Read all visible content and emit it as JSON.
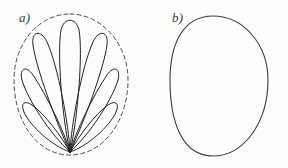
{
  "figure": {
    "background_color": "#fdfdfd",
    "width": 288,
    "height": 168,
    "panels": [
      {
        "id": "a",
        "label": "a)",
        "description": "Fan of seven narrow petal-shaped loops radiating from a single common point at the bottom, inscribed in a dashed ovoid envelope",
        "label_x": 19,
        "label_y": 10,
        "origin": {
          "x": 70,
          "y": 152
        },
        "envelope": {
          "style": "dashed",
          "color": "#4a4a4a",
          "dash": "4 3.2",
          "shape": "ovoid",
          "center_x": 70,
          "top_y": 14,
          "bottom_y": 155,
          "left_x": 14,
          "right_x": 128
        },
        "petal_count": 7,
        "petal_color": "#222222",
        "petals": [
          {
            "index": 0,
            "angle_deg": -74,
            "tip_x": 26,
            "tip_y": 107,
            "width": 11
          },
          {
            "index": 1,
            "angle_deg": -50,
            "tip_x": 22,
            "tip_y": 75,
            "width": 12
          },
          {
            "index": 2,
            "angle_deg": -25,
            "tip_x": 34,
            "tip_y": 33,
            "width": 13
          },
          {
            "index": 3,
            "angle_deg": 0,
            "tip_x": 70,
            "tip_y": 20,
            "width": 14
          },
          {
            "index": 4,
            "angle_deg": 25,
            "tip_x": 106,
            "tip_y": 33,
            "width": 13
          },
          {
            "index": 5,
            "angle_deg": 50,
            "tip_x": 118,
            "tip_y": 75,
            "width": 12
          },
          {
            "index": 6,
            "angle_deg": 74,
            "tip_x": 114,
            "tip_y": 107,
            "width": 11
          }
        ]
      },
      {
        "id": "b",
        "label": "b)",
        "description": "Single solid egg-shaped (ovoid) closed outline, broad rounded dome at top narrowing toward a rounded point at the bottom",
        "label_x": 28,
        "label_y": 10,
        "outline": {
          "style": "solid",
          "color": "#3b3b3b",
          "shape": "ovoid",
          "center_x": 69,
          "top_y": 16,
          "bottom_y": 156,
          "left_x": 26,
          "right_x": 124
        }
      }
    ]
  }
}
